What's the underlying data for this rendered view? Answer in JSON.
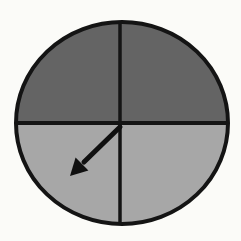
{
  "figure": {
    "quadrants": [
      {
        "position": "top-left",
        "shade": "dark"
      },
      {
        "position": "top-right",
        "shade": "dark"
      },
      {
        "position": "bottom-left",
        "shade": "light"
      },
      {
        "position": "bottom-right",
        "shade": "light"
      }
    ],
    "arrow": {
      "points_to": "bottom-left",
      "angle_deg": 225
    },
    "colors": {
      "dark_quadrant": "#646464",
      "light_quadrant": "#a7a7a7",
      "outline": "#141414",
      "divider": "#141414",
      "arrow": "#101010",
      "background": "#fbfbf8"
    }
  }
}
